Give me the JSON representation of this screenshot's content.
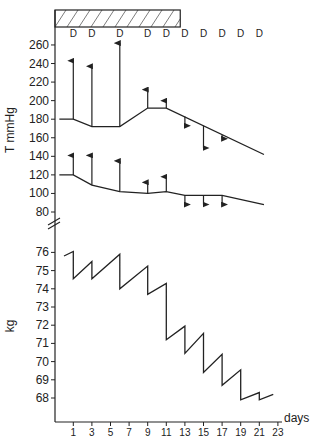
{
  "chart_data": {
    "type": "line",
    "title": "",
    "xlabel": "days",
    "x_ticks": [
      1,
      3,
      5,
      7,
      9,
      11,
      13,
      15,
      17,
      19,
      21,
      23
    ],
    "treatment_bar": {
      "start_day": -1,
      "end_day": 12.5,
      "pattern": "hatched"
    },
    "dialysis_markers": {
      "label": "D",
      "days": [
        1,
        3,
        6,
        9,
        11,
        13,
        15,
        17,
        19,
        21
      ]
    },
    "panels": [
      {
        "name": "blood-pressure",
        "ylabel": "T mmHg",
        "y_ticks": [
          80,
          100,
          120,
          140,
          160,
          180,
          200,
          220,
          240,
          260
        ],
        "ylim": [
          80,
          260
        ],
        "series": [
          {
            "name": "Systolic (pre-dialysis)",
            "points": [
              [
                -0.5,
                180
              ],
              [
                1,
                180
              ],
              [
                3,
                172
              ],
              [
                6,
                172
              ],
              [
                9,
                192
              ],
              [
                11,
                192
              ],
              [
                21.5,
                142
              ]
            ],
            "arrows": [
              {
                "day": 1,
                "from": 180,
                "to": 243
              },
              {
                "day": 3,
                "from": 172,
                "to": 237
              },
              {
                "day": 6,
                "from": 172,
                "to": 262
              },
              {
                "day": 9,
                "from": 192,
                "to": 212
              },
              {
                "day": 11,
                "from": 192,
                "to": 200
              },
              {
                "day": 13,
                "from": 183,
                "to": 173
              },
              {
                "day": 15,
                "from": 173,
                "to": 149
              },
              {
                "day": 17,
                "from": 163,
                "to": 159
              }
            ]
          },
          {
            "name": "Diastolic (pre-dialysis)",
            "points": [
              [
                -0.5,
                120
              ],
              [
                1,
                120
              ],
              [
                3,
                109
              ],
              [
                6,
                102
              ],
              [
                9,
                100
              ],
              [
                11,
                102
              ],
              [
                13,
                98
              ],
              [
                17,
                98
              ],
              [
                21.5,
                88
              ]
            ],
            "arrows": [
              {
                "day": 1,
                "from": 120,
                "to": 141
              },
              {
                "day": 3,
                "from": 109,
                "to": 141
              },
              {
                "day": 6,
                "from": 102,
                "to": 135
              },
              {
                "day": 9,
                "from": 100,
                "to": 112
              },
              {
                "day": 11,
                "from": 102,
                "to": 118
              },
              {
                "day": 13,
                "from": 98,
                "to": 88
              },
              {
                "day": 15,
                "from": 98,
                "to": 88
              },
              {
                "day": 17,
                "from": 98,
                "to": 88
              }
            ]
          }
        ]
      },
      {
        "name": "body-weight",
        "ylabel": "kg",
        "y_ticks": [
          68,
          69,
          70,
          71,
          72,
          73,
          74,
          75,
          76
        ],
        "ylim": [
          67,
          76.5
        ],
        "series": [
          {
            "name": "Body weight",
            "points": [
              [
                0,
                75.8
              ],
              [
                1,
                76.05
              ],
              [
                1,
                74.55
              ],
              [
                3,
                75.5
              ],
              [
                3,
                74.55
              ],
              [
                6,
                75.9
              ],
              [
                6,
                74.0
              ],
              [
                9,
                75.25
              ],
              [
                9,
                73.7
              ],
              [
                11,
                74.3
              ],
              [
                11,
                71.2
              ],
              [
                13,
                71.95
              ],
              [
                13,
                70.45
              ],
              [
                15,
                71.55
              ],
              [
                15,
                69.4
              ],
              [
                17,
                70.4
              ],
              [
                17,
                68.7
              ],
              [
                19,
                69.55
              ],
              [
                19,
                67.9
              ],
              [
                21,
                68.3
              ],
              [
                21,
                67.9
              ],
              [
                22.5,
                68.2
              ]
            ]
          }
        ]
      }
    ],
    "axis_break": true,
    "grid": false
  }
}
